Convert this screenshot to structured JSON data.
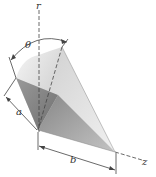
{
  "figure": {
    "labels": {
      "r_axis": "r",
      "z_axis": "z",
      "angle": "θ",
      "dim_a": "a",
      "dim_b": "b"
    },
    "colors": {
      "light_face": "#e8e8e8",
      "mid_face": "#b5b5b5",
      "dark_face": "#8a8a8a",
      "line": "#444444"
    }
  }
}
